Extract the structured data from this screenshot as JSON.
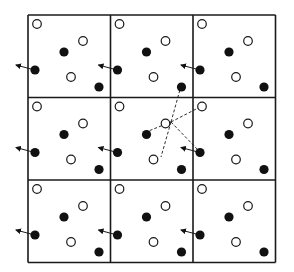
{
  "figure": {
    "grid": {
      "x0": 28,
      "y0": 15,
      "cell": 82.5,
      "rows": 3,
      "cols": 3
    },
    "colors": {
      "line": "#1a1a1a",
      "filled": "#111111",
      "open_fill": "#ffffff",
      "background": "#ffffff"
    },
    "particles": [
      {
        "dx": 9,
        "dy": 9,
        "type": "open"
      },
      {
        "dx": 55,
        "dy": 26,
        "type": "open"
      },
      {
        "dx": 36,
        "dy": 37,
        "type": "filled"
      },
      {
        "dx": 7,
        "dy": 55,
        "type": "filled",
        "arrow": true
      },
      {
        "dx": 43,
        "dy": 62,
        "type": "open"
      },
      {
        "dx": 71,
        "dy": 72,
        "type": "filled"
      }
    ],
    "arrow": {
      "from_dx": -12,
      "from_dy": 50
    },
    "center_particle": {
      "x": 171,
      "y": 122
    },
    "neighbors": [
      {
        "x": 181,
        "y": 86
      },
      {
        "x": 202,
        "y": 106
      },
      {
        "x": 146,
        "y": 132
      },
      {
        "x": 161,
        "y": 157
      },
      {
        "x": 200,
        "y": 152
      }
    ]
  }
}
